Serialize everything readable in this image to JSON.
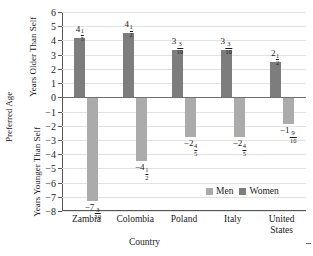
{
  "chart_data": {
    "type": "bar",
    "title": "",
    "xlabel": "Country",
    "ylabel": "Preferred Age",
    "ylabel_upper": "Years Older Than Self",
    "ylabel_lower": "Years Younger Than Self",
    "categories": [
      "Zambia",
      "Colombia",
      "Poland",
      "Italy",
      "United States"
    ],
    "ylim": [
      -8,
      6
    ],
    "ytick_labels": [
      "6",
      "5",
      "4",
      "3",
      "2",
      "1",
      "0",
      "−1",
      "−2",
      "−3",
      "−4",
      "−5",
      "−6",
      "−7",
      "−8"
    ],
    "ytick_values": [
      6,
      5,
      4,
      3,
      2,
      1,
      0,
      -1,
      -2,
      -3,
      -4,
      -5,
      -6,
      -7,
      -8
    ],
    "grid": true,
    "legend_position": "inside-bottom-right",
    "series": [
      {
        "name": "Women",
        "color": "#7d7d7d",
        "values": [
          4.2,
          4.5,
          3.3,
          3.3,
          2.5
        ],
        "labels": [
          {
            "whole": "4",
            "num": "1",
            "den": "5"
          },
          {
            "whole": "4",
            "num": "1",
            "den": "2"
          },
          {
            "whole": "3",
            "num": "3",
            "den": "10"
          },
          {
            "whole": "3",
            "num": "3",
            "den": "10"
          },
          {
            "whole": "2",
            "num": "1",
            "den": "2"
          }
        ]
      },
      {
        "name": "Men",
        "color": "#ababab",
        "values": [
          -7.3,
          -4.5,
          -2.8,
          -2.8,
          -1.9
        ],
        "labels": [
          {
            "whole": "−7",
            "num": "3",
            "den": "10"
          },
          {
            "whole": "−4",
            "num": "1",
            "den": "2"
          },
          {
            "whole": "−2",
            "num": "4",
            "den": "5"
          },
          {
            "whole": "−2",
            "num": "4",
            "den": "5"
          },
          {
            "whole": "−1",
            "num": "9",
            "den": "10"
          }
        ]
      }
    ]
  },
  "legend": {
    "men_label": "Men",
    "women_label": "Women"
  }
}
